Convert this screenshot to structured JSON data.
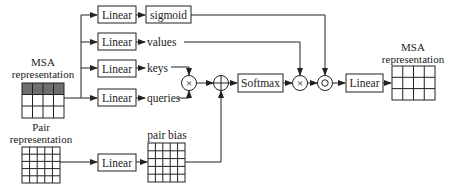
{
  "diagram": {
    "type": "gated-self-attention-with-pair-bias",
    "inputs": {
      "msa": {
        "title_line1": "MSA",
        "title_line2": "representation",
        "grid": {
          "cols": 4,
          "rows": 3,
          "highlighted_row": 0
        }
      },
      "pair": {
        "title_line1": "Pair",
        "title_line2": "representation",
        "grid": {
          "cols": 5,
          "rows": 5
        }
      }
    },
    "linear_label": "Linear",
    "branches": [
      {
        "id": "gate",
        "linear": "Linear",
        "output": "sigmoid",
        "output_boxed": true
      },
      {
        "id": "values",
        "linear": "Linear",
        "output": "values",
        "output_boxed": false
      },
      {
        "id": "keys",
        "linear": "Linear",
        "output": "keys",
        "output_boxed": false
      },
      {
        "id": "queries",
        "linear": "Linear",
        "output": "queries",
        "output_boxed": false
      }
    ],
    "pair_branch": {
      "linear": "Linear",
      "output": "pair bias",
      "grid": {
        "cols": 5,
        "rows": 5
      }
    },
    "operators": {
      "dot": "×",
      "add": "+",
      "softmax": "Softmax",
      "weighted": "×",
      "gate_product": "○",
      "final_linear": "Linear"
    },
    "output": {
      "title_line1": "MSA",
      "title_line2": "representation",
      "grid": {
        "cols": 4,
        "rows": 3
      }
    },
    "colors": {
      "line": "#222222",
      "highlight": "#6e6e6e",
      "background": "#ffffff"
    }
  }
}
